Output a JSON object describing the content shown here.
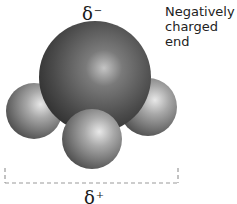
{
  "diagram": {
    "labels": {
      "delta_minus": {
        "symbol": "δ",
        "sign": "−"
      },
      "delta_plus": {
        "symbol": "δ",
        "sign": "+"
      },
      "caption_line1": "Negatively",
      "caption_line2": "charged end"
    },
    "atoms": [
      {
        "role": "central-atom",
        "cx": 95,
        "cy": 77,
        "r": 56,
        "shade": "dark"
      },
      {
        "role": "outer-atom-left",
        "cx": 34,
        "cy": 111,
        "r": 28,
        "shade": "medium"
      },
      {
        "role": "outer-atom-right",
        "cx": 148,
        "cy": 107,
        "r": 29,
        "shade": "medium"
      },
      {
        "role": "outer-atom-bottom",
        "cx": 92,
        "cy": 139,
        "r": 30,
        "shade": "medium"
      }
    ],
    "bracket": {
      "x1": 5,
      "x2": 178,
      "y_top": 168,
      "y_bottom": 183,
      "style": "dashed",
      "color": "#9a9a9a"
    },
    "colors": {
      "central_dark": "#3a3a3a",
      "central_highlight": "#c8c8c8",
      "outer_dark": "#4a4a4a",
      "outer_highlight": "#e6e6e6"
    }
  }
}
